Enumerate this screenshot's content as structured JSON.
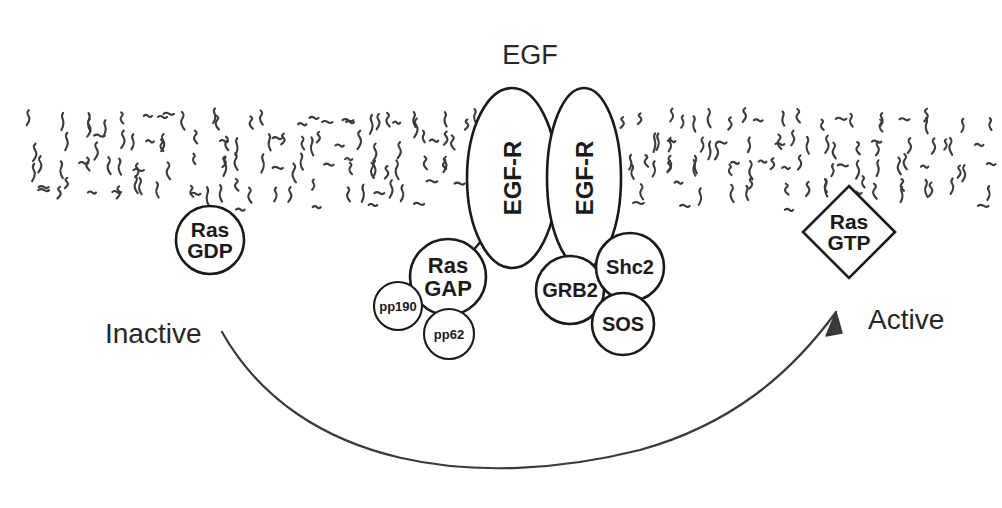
{
  "figure": {
    "title_label": "EGF",
    "background_color": "#ffffff",
    "stroke_color": "#1a1a1a",
    "membrane_color": "#3a3a3a"
  },
  "ligand": {
    "label": "EGF",
    "x": 530,
    "y": 55,
    "font_size": 27
  },
  "membrane": {
    "name": "lipid-bilayer",
    "left": 28,
    "right": 976,
    "top": 108,
    "bottom": 203
  },
  "receptors": [
    {
      "label": "EGF-R",
      "cx": 512,
      "cy": 178,
      "rx": 45,
      "ry": 90,
      "rotated": true,
      "font_size": 24
    },
    {
      "label": "EGF-R",
      "cx": 584,
      "cy": 178,
      "rx": 37,
      "ry": 90,
      "rotated": true,
      "font_size": 24
    }
  ],
  "nodes": [
    {
      "id": "ras-gdp",
      "shape": "circle",
      "lines": [
        "Ras",
        "GDP"
      ],
      "cx": 210,
      "cy": 240,
      "r": 34,
      "font_size": 21
    },
    {
      "id": "ras-gap",
      "shape": "circle",
      "lines": [
        "Ras",
        "GAP"
      ],
      "cx": 448,
      "cy": 277,
      "r": 38,
      "font_size": 22
    },
    {
      "id": "pp190",
      "shape": "circle",
      "lines": [
        "pp190"
      ],
      "cx": 398,
      "cy": 306,
      "r": 24,
      "font_size": 13
    },
    {
      "id": "pp62",
      "shape": "circle",
      "lines": [
        "pp62"
      ],
      "cx": 449,
      "cy": 334,
      "r": 25,
      "font_size": 13
    },
    {
      "id": "grb2",
      "shape": "circle",
      "lines": [
        "GRB2"
      ],
      "cx": 570,
      "cy": 290,
      "r": 34,
      "font_size": 20
    },
    {
      "id": "shc2",
      "shape": "circle",
      "lines": [
        "Shc2"
      ],
      "cx": 630,
      "cy": 267,
      "r": 34,
      "font_size": 20
    },
    {
      "id": "sos",
      "shape": "circle",
      "lines": [
        "SOS"
      ],
      "cx": 623,
      "cy": 324,
      "r": 31,
      "font_size": 20
    },
    {
      "id": "ras-gtp",
      "shape": "diamond",
      "lines": [
        "Ras",
        "GTP"
      ],
      "cx": 849,
      "cy": 232,
      "r": 46,
      "font_size": 21
    }
  ],
  "annotations": {
    "inactive": {
      "label": "Inactive",
      "x": 105,
      "y": 333,
      "font_size": 28
    },
    "active": {
      "label": "Active",
      "x": 868,
      "y": 319,
      "font_size": 28
    }
  },
  "flow_arrow": {
    "name": "activation-arrow",
    "path": "M 222 332 C 300 470 480 490 640 450 C 730 425 790 375 836 312",
    "arrowhead": "M 836 312 L 826 336 L 842 333 Z"
  },
  "connector": {
    "from": "ras-gap",
    "to": "egf-receptor-left",
    "path": "M 470 254 L 489 232"
  }
}
